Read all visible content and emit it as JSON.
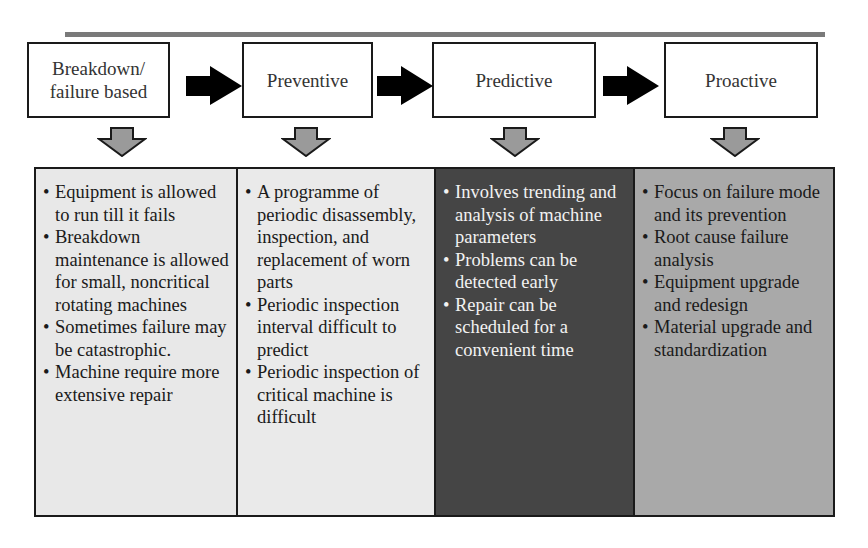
{
  "diagram": {
    "type": "maintenance-strategy-evolution",
    "stages": [
      {
        "id": "breakdown",
        "title": "Breakdown/\nfailure based",
        "panel_color": "#e8e8e8",
        "text_color": "#1a1a1a",
        "points": [
          "Equipment is allowed to run till it fails",
          "Breakdown maintenance is allowed for small, noncritical rotating machines",
          "Sometimes failure may be catastrophic.",
          "Machine require more extensive repair"
        ]
      },
      {
        "id": "preventive",
        "title": "Preventive",
        "panel_color": "#eaeaea",
        "text_color": "#1a1a1a",
        "points": [
          "A programme of periodic disassembly, inspection, and replacement of worn parts",
          "Periodic inspection interval difficult to predict",
          "Periodic inspection of critical machine is difficult"
        ]
      },
      {
        "id": "predictive",
        "title": "Predictive",
        "panel_color": "#454545",
        "text_color": "#f2f2f2",
        "points": [
          "Involves trending and analysis of machine parameters",
          "Problems can be detected early",
          "Repair can be scheduled for a convenient time"
        ]
      },
      {
        "id": "proactive",
        "title": "Proactive",
        "panel_color": "#a9a9a9",
        "text_color": "#1a1a1a",
        "points": [
          "Focus on failure mode and its prevention",
          "Root cause failure analysis",
          "Equipment upgrade and redesign",
          "Material upgrade and standardization"
        ]
      }
    ],
    "colors": {
      "top_bar": "#7a7a7a",
      "flow_arrow": "#000000",
      "down_arrow_fill": "#9a9a9a",
      "border": "#1a1a1a"
    }
  }
}
